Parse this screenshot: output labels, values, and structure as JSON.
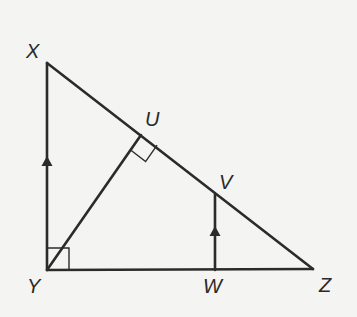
{
  "diagram": {
    "type": "geometry-triangle",
    "vertices": {
      "X": {
        "label": "X",
        "x": 47,
        "y": 63,
        "label_x": 26,
        "label_y": 58
      },
      "Y": {
        "label": "Y",
        "x": 47,
        "y": 270,
        "label_x": 27,
        "label_y": 293
      },
      "Z": {
        "label": "Z",
        "x": 313,
        "y": 269,
        "label_x": 319,
        "label_y": 292
      },
      "U": {
        "label": "U",
        "x": 141,
        "y": 135,
        "label_x": 145,
        "label_y": 126
      },
      "V": {
        "label": "V",
        "x": 215,
        "y": 194,
        "label_x": 219,
        "label_y": 189
      },
      "W": {
        "label": "W",
        "x": 215,
        "y": 270,
        "label_x": 203,
        "label_y": 293
      }
    },
    "segments": [
      {
        "from": "X",
        "to": "Y"
      },
      {
        "from": "Y",
        "to": "Z"
      },
      {
        "from": "X",
        "to": "Z"
      },
      {
        "from": "Y",
        "to": "U"
      },
      {
        "from": "V",
        "to": "W"
      }
    ],
    "right_angles": [
      "XYZ at Y",
      "YUZ at U"
    ],
    "parallel_marks": [
      "XY",
      "VW"
    ],
    "stroke_color": "#2b2b2b",
    "background_color": "#f4f4f2"
  }
}
